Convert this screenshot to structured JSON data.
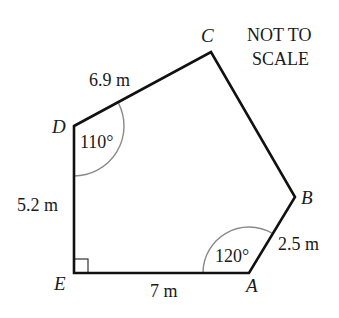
{
  "figure": {
    "type": "pentagon",
    "note_line1": "NOT TO",
    "note_line2": "SCALE",
    "vertices": {
      "A": {
        "label": "A"
      },
      "B": {
        "label": "B"
      },
      "C": {
        "label": "C"
      },
      "D": {
        "label": "D"
      },
      "E": {
        "label": "E"
      }
    },
    "sides": {
      "DC": {
        "length": "6.9 m"
      },
      "ED": {
        "length": "5.2 m"
      },
      "EA": {
        "length": "7 m"
      },
      "AB": {
        "length": "2.5 m"
      }
    },
    "angles": {
      "D": {
        "value": "110°"
      },
      "A": {
        "value": "120°"
      },
      "E": {
        "value": "right angle"
      }
    },
    "colors": {
      "line": "#111111",
      "arc": "#888888",
      "text": "#1a1a1a"
    }
  }
}
